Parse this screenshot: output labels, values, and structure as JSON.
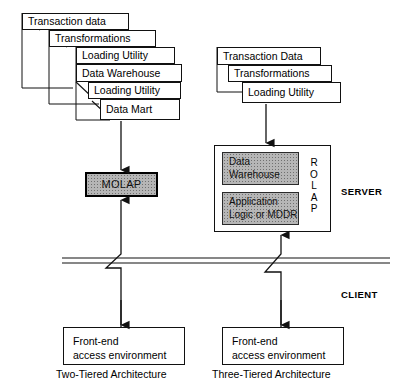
{
  "diagram": {
    "title_not_shown": "",
    "left_stack": [
      {
        "label": "Transaction data"
      },
      {
        "label": "Transformations"
      },
      {
        "label": "Loading Utility"
      },
      {
        "label": "Data Warehouse"
      },
      {
        "label": "Loading Utility"
      },
      {
        "label": "Data Mart"
      }
    ],
    "right_stack": [
      {
        "label": "Transaction Data"
      },
      {
        "label": "Transformations"
      },
      {
        "label": "Loading Utility"
      }
    ],
    "molap": {
      "label": "MOLAP"
    },
    "rolap": {
      "letters": "R\nO\nL\nA\nP",
      "inner_boxes": [
        {
          "label": "Data\nWarehouse"
        },
        {
          "label": "Application\nLogic or MDDR"
        }
      ]
    },
    "tier_labels": {
      "server": "SERVER",
      "client": "CLIENT"
    },
    "frontend_boxes": [
      {
        "label": "Front-end\naccess environment"
      },
      {
        "label": "Front-end\naccess environment"
      }
    ],
    "captions": [
      {
        "label": "Two-Tiered Architecture"
      },
      {
        "label": "Three-Tiered Architecture"
      }
    ],
    "colors": {
      "ink": "#111111",
      "shade": "#b6b6b6",
      "paper": "#ffffff"
    }
  }
}
